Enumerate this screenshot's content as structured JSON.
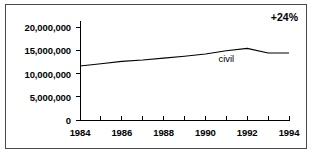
{
  "chart_data": {
    "type": "line",
    "title": "",
    "xlabel": "",
    "ylabel": "",
    "grid": false,
    "legend_position": "inline-label",
    "annotations": [
      {
        "name": "growth",
        "text": "+24%",
        "position": "top-right"
      }
    ],
    "x": [
      1984,
      1985,
      1986,
      1987,
      1988,
      1989,
      1990,
      1991,
      1992,
      1993,
      1994
    ],
    "xlim": [
      1984,
      1994
    ],
    "ylim": [
      0,
      20000000
    ],
    "yticks": [
      0,
      5000000,
      10000000,
      15000000,
      20000000
    ],
    "ytick_labels": [
      "0",
      "5,000,000",
      "10,000,000",
      "15,000,000",
      "20,000,000"
    ],
    "xticks": [
      1984,
      1985,
      1986,
      1987,
      1988,
      1989,
      1990,
      1991,
      1992,
      1993,
      1994
    ],
    "xtick_labels": [
      "1984",
      "",
      "1986",
      "",
      "1988",
      "",
      "1990",
      "",
      "1992",
      "",
      "1994"
    ],
    "xtick_labels_visible": [
      "1984",
      "1986",
      "1988",
      "1990",
      "1992",
      "1994"
    ],
    "series": [
      {
        "name": "civil",
        "label": "civil",
        "color": "#000000",
        "values": [
          11600000,
          12100000,
          12600000,
          12900000,
          13300000,
          13700000,
          14200000,
          14900000,
          15400000,
          14400000,
          14400000
        ]
      }
    ]
  },
  "axes": {
    "y_labels": [
      {
        "value": 20000000,
        "text": "20,000,000"
      },
      {
        "value": 15000000,
        "text": "15,000,000"
      },
      {
        "value": 10000000,
        "text": "10,000,000"
      },
      {
        "value": 5000000,
        "text": "5,000,000"
      },
      {
        "value": 0,
        "text": "0"
      }
    ],
    "x_labels": [
      {
        "value": 1984,
        "text": "1984"
      },
      {
        "value": 1986,
        "text": "1986"
      },
      {
        "value": 1988,
        "text": "1988"
      },
      {
        "value": 1990,
        "text": "1990"
      },
      {
        "value": 1992,
        "text": "1992"
      },
      {
        "value": 1994,
        "text": "1994"
      }
    ]
  },
  "annotation": {
    "growth_text": "+24%"
  },
  "series_label": {
    "civil": "civil"
  },
  "colors": {
    "line": "#000000",
    "axis": "#000000",
    "border": "#4a4a4a",
    "background": "#ffffff",
    "text": "#000000"
  }
}
